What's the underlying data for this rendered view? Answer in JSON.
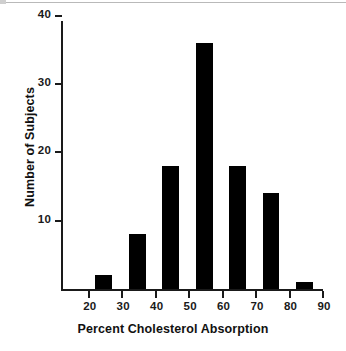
{
  "chart_data": {
    "type": "bar",
    "title": "",
    "subtitle": "",
    "xlabel": "Percent Cholesterol Absorption",
    "ylabel": "Number of Subjects",
    "xlim": [
      12,
      90
    ],
    "ylim": [
      0,
      41
    ],
    "xticks": [
      20,
      30,
      40,
      50,
      60,
      70,
      80,
      90
    ],
    "xtick_labels": [
      "20",
      "30",
      "40",
      "50",
      "60",
      "70",
      "80",
      "90"
    ],
    "yticks": [
      10,
      20,
      30,
      40
    ],
    "ytick_labels": [
      "10",
      "20",
      "30",
      "40"
    ],
    "grid": false,
    "legend": null,
    "bar_color": "#000000",
    "axis_color": "#1a1a1a",
    "bin_width": 5,
    "bins": [
      {
        "label": "22-27",
        "x_start": 22,
        "x_end": 27,
        "value": 2
      },
      {
        "label": "32-37",
        "x_start": 32,
        "x_end": 37,
        "value": 8
      },
      {
        "label": "42-47",
        "x_start": 42,
        "x_end": 47,
        "value": 18
      },
      {
        "label": "52-57",
        "x_start": 52,
        "x_end": 57,
        "value": 36
      },
      {
        "label": "62-67",
        "x_start": 62,
        "x_end": 67,
        "value": 18
      },
      {
        "label": "72-77",
        "x_start": 72,
        "x_end": 77,
        "value": 14
      },
      {
        "label": "82-87",
        "x_start": 82,
        "x_end": 87,
        "value": 1
      }
    ],
    "categories": [
      "22-27",
      "32-37",
      "42-47",
      "52-57",
      "62-67",
      "72-77",
      "82-87"
    ],
    "values": [
      2,
      8,
      18,
      36,
      18,
      14,
      1
    ]
  }
}
